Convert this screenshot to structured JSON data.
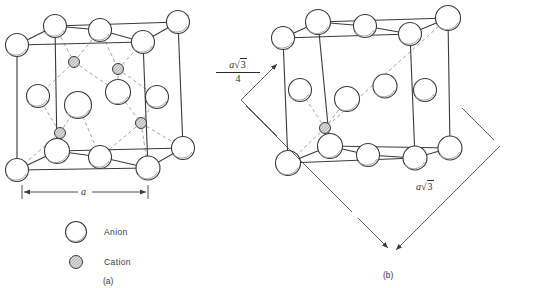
{
  "figure": {
    "type": "crystal-structure-diagram",
    "panels": [
      {
        "id": "a",
        "caption": "(a)",
        "dimension_labels": [
          "a"
        ]
      },
      {
        "id": "b",
        "caption": "(b)",
        "dimension_labels": [
          "a√3 / 4",
          "a√3"
        ]
      }
    ]
  },
  "legend": {
    "items": [
      {
        "key": "anion",
        "label": "Anion",
        "marker": "large-open-circle",
        "fill": "#ffffff",
        "stroke": "#333333"
      },
      {
        "key": "cation",
        "label": "Cation",
        "marker": "small-hatched-circle",
        "fill": "#d2d2d2",
        "stroke": "#333333"
      }
    ]
  },
  "panel_a": {
    "caption": "(a)",
    "dimension": {
      "label": "a",
      "label_italic": "a",
      "orientation": "horizontal",
      "position": "below-cell"
    },
    "anions": [
      {
        "cx": 17,
        "cy": 45,
        "r": 11.5,
        "role": "corner-front-top-left"
      },
      {
        "cx": 55,
        "cy": 26,
        "r": 11.5,
        "role": "corner-back-top-left"
      },
      {
        "cx": 100,
        "cy": 30,
        "r": 11.5,
        "role": "edge-back-top-mid"
      },
      {
        "cx": 143,
        "cy": 42,
        "r": 11.5,
        "role": "corner-front-top-right"
      },
      {
        "cx": 178,
        "cy": 22,
        "r": 11.5,
        "role": "corner-back-top-right"
      },
      {
        "cx": 38,
        "cy": 96,
        "r": 11.5,
        "role": "face-left"
      },
      {
        "cx": 78,
        "cy": 105,
        "r": 13.5,
        "role": "face-front-center"
      },
      {
        "cx": 118,
        "cy": 92,
        "r": 12.5,
        "role": "face-center"
      },
      {
        "cx": 157,
        "cy": 97,
        "r": 11.5,
        "role": "face-right"
      },
      {
        "cx": 17,
        "cy": 170,
        "r": 11.5,
        "role": "corner-front-bottom-left"
      },
      {
        "cx": 57,
        "cy": 151,
        "r": 12.5,
        "role": "corner-back-bottom-left"
      },
      {
        "cx": 100,
        "cy": 157,
        "r": 11.5,
        "role": "edge-bottom-mid"
      },
      {
        "cx": 148,
        "cy": 168,
        "r": 12.0,
        "role": "corner-front-bottom-right"
      },
      {
        "cx": 183,
        "cy": 148,
        "r": 11.5,
        "role": "corner-back-bottom-right"
      }
    ],
    "cations": [
      {
        "cx": 74,
        "cy": 62,
        "r": 5.5,
        "role": "tetrahedral-site-1"
      },
      {
        "cx": 118,
        "cy": 69,
        "r": 5.5,
        "role": "tetrahedral-site-2"
      },
      {
        "cx": 60,
        "cy": 133,
        "r": 5.5,
        "role": "tetrahedral-site-3"
      },
      {
        "cx": 141,
        "cy": 123,
        "r": 5.5,
        "role": "tetrahedral-site-4"
      }
    ]
  },
  "panel_b": {
    "caption": "(b)",
    "dimensions": [
      {
        "id": "quarter-diagonal",
        "numerator": "a√3",
        "denominator": "4",
        "a": "a",
        "radicand": "3"
      },
      {
        "id": "body-diagonal",
        "label": "a√3",
        "a": "a",
        "radicand": "3"
      }
    ],
    "anions": [
      {
        "cx": 283,
        "cy": 38,
        "r": 11.5,
        "role": "corner-front-top-left"
      },
      {
        "cx": 318,
        "cy": 22,
        "r": 12.5,
        "role": "corner-back-top-left"
      },
      {
        "cx": 365,
        "cy": 26,
        "r": 11.5,
        "role": "edge-back-top-mid"
      },
      {
        "cx": 410,
        "cy": 34,
        "r": 11.5,
        "role": "corner-front-top-right"
      },
      {
        "cx": 448,
        "cy": 18,
        "r": 12.5,
        "role": "corner-back-top-right"
      },
      {
        "cx": 300,
        "cy": 90,
        "r": 11.5,
        "role": "face-left"
      },
      {
        "cx": 347,
        "cy": 99,
        "r": 12.5,
        "role": "face-front-center"
      },
      {
        "cx": 385,
        "cy": 86,
        "r": 12.0,
        "role": "face-center"
      },
      {
        "cx": 425,
        "cy": 90,
        "r": 11.5,
        "role": "face-right"
      },
      {
        "cx": 288,
        "cy": 163,
        "r": 12.5,
        "role": "corner-front-bottom-left"
      },
      {
        "cx": 330,
        "cy": 146,
        "r": 12.5,
        "role": "corner-back-bottom-left"
      },
      {
        "cx": 368,
        "cy": 155,
        "r": 11.5,
        "role": "edge-bottom-mid"
      },
      {
        "cx": 415,
        "cy": 158,
        "r": 12.0,
        "role": "corner-front-bottom-right"
      },
      {
        "cx": 450,
        "cy": 148,
        "r": 12.0,
        "role": "corner-back-bottom-right"
      }
    ],
    "cations": [
      {
        "cx": 325,
        "cy": 128,
        "r": 5.5,
        "role": "tetrahedral-site-on-diagonal"
      }
    ]
  },
  "colors": {
    "line": "#333333",
    "dashed": "#8a8a8a",
    "anion_fill": "#ffffff",
    "cation_fill": "#d2d2d2",
    "text": "#2b2b2b",
    "background": "#ffffff"
  }
}
